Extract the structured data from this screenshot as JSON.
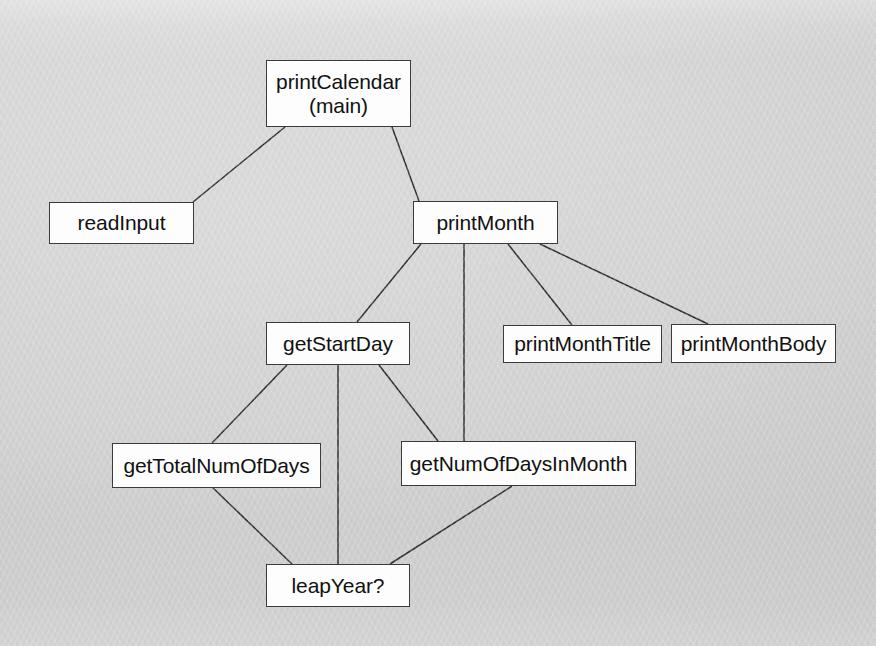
{
  "diagram": {
    "type": "structure-chart",
    "style": {
      "node_fill": "#fdfdfd",
      "node_border": "#3b3b3b",
      "edge_color": "#2e2e2e",
      "text_color": "#111111",
      "background": "#e8e8e8"
    },
    "nodes": [
      {
        "id": "printCalendar",
        "label": "printCalendar\n(main)",
        "x": 266,
        "y": 60,
        "w": 145,
        "h": 67
      },
      {
        "id": "readInput",
        "label": "readInput",
        "x": 49,
        "y": 202,
        "w": 145,
        "h": 42
      },
      {
        "id": "printMonth",
        "label": "printMonth",
        "x": 413,
        "y": 201,
        "w": 145,
        "h": 43
      },
      {
        "id": "getStartDay",
        "label": "getStartDay",
        "x": 266,
        "y": 322,
        "w": 144,
        "h": 43
      },
      {
        "id": "printMonthTitle",
        "label": "printMonthTitle",
        "x": 503,
        "y": 325,
        "w": 159,
        "h": 38
      },
      {
        "id": "printMonthBody",
        "label": "printMonthBody",
        "x": 671,
        "y": 324,
        "w": 165,
        "h": 39
      },
      {
        "id": "getTotalNumOfDays",
        "label": "getTotalNumOfDays",
        "x": 112,
        "y": 443,
        "w": 209,
        "h": 45
      },
      {
        "id": "getNumOfDaysInMonth",
        "label": "getNumOfDaysInMonth",
        "x": 401,
        "y": 441,
        "w": 235,
        "h": 45
      },
      {
        "id": "leapYear",
        "label": "leapYear?",
        "x": 266,
        "y": 564,
        "w": 144,
        "h": 43
      }
    ],
    "edges": [
      {
        "from": "printCalendar",
        "to": "readInput",
        "x1": 285,
        "y1": 127,
        "x2": 193,
        "y2": 202
      },
      {
        "from": "printCalendar",
        "to": "printMonth",
        "x1": 392,
        "y1": 127,
        "x2": 419,
        "y2": 201
      },
      {
        "from": "printMonth",
        "to": "getStartDay",
        "x1": 421,
        "y1": 244,
        "x2": 357,
        "y2": 322
      },
      {
        "from": "printMonth",
        "to": "getNumOfDaysInMonth",
        "x1": 464,
        "y1": 244,
        "x2": 464,
        "y2": 441
      },
      {
        "from": "printMonth",
        "to": "printMonthTitle",
        "x1": 508,
        "y1": 244,
        "x2": 572,
        "y2": 325
      },
      {
        "from": "printMonth",
        "to": "printMonthBody",
        "x1": 540,
        "y1": 244,
        "x2": 708,
        "y2": 324
      },
      {
        "from": "getStartDay",
        "to": "getTotalNumOfDays",
        "x1": 287,
        "y1": 365,
        "x2": 212,
        "y2": 443
      },
      {
        "from": "getStartDay",
        "to": "leapYear",
        "x1": 338,
        "y1": 365,
        "x2": 338,
        "y2": 564
      },
      {
        "from": "getStartDay",
        "to": "getNumOfDaysInMonth",
        "x1": 379,
        "y1": 365,
        "x2": 438,
        "y2": 441
      },
      {
        "from": "getTotalNumOfDays",
        "to": "leapYear",
        "x1": 213,
        "y1": 488,
        "x2": 292,
        "y2": 564
      },
      {
        "from": "getNumOfDaysInMonth",
        "to": "leapYear",
        "x1": 512,
        "y1": 486,
        "x2": 390,
        "y2": 564
      }
    ]
  }
}
